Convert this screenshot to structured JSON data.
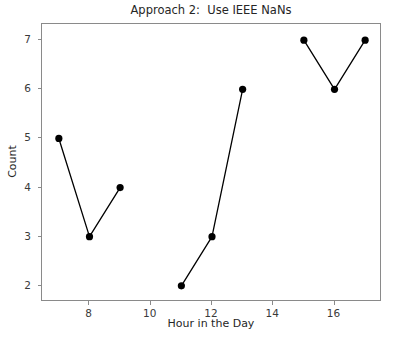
{
  "chart_data": {
    "type": "line",
    "title": "Approach 2:  Use IEEE NaNs",
    "xlabel": "Hour in the Day",
    "ylabel": "Count",
    "xlim": [
      6.45,
      17.55
    ],
    "ylim": [
      1.67,
      7.33
    ],
    "xticks": [
      8,
      10,
      12,
      14,
      16
    ],
    "xtick_labels": [
      "8",
      "10",
      "12",
      "14",
      "16"
    ],
    "yticks": [
      2,
      3,
      4,
      5,
      6,
      7
    ],
    "ytick_labels": [
      "2",
      "3",
      "4",
      "5",
      "6",
      "7"
    ],
    "grid": false,
    "legend": null,
    "marker": "o",
    "marker_size": 6,
    "line_width": 1.3,
    "series": [
      {
        "name": "Count",
        "color": "#000000",
        "x": [
          7,
          8,
          9,
          10,
          11,
          12,
          13,
          14,
          15,
          16,
          17
        ],
        "y": [
          5,
          3,
          4,
          null,
          2,
          3,
          6,
          null,
          7,
          6,
          7
        ],
        "nan_gaps_at_x": [
          10,
          14
        ],
        "points": [
          {
            "x": 7,
            "y": 5
          },
          {
            "x": 8,
            "y": 3
          },
          {
            "x": 9,
            "y": 4
          },
          {
            "x": 11,
            "y": 2
          },
          {
            "x": 12,
            "y": 3
          },
          {
            "x": 13,
            "y": 6
          },
          {
            "x": 15,
            "y": 7
          },
          {
            "x": 16,
            "y": 6
          },
          {
            "x": 17,
            "y": 7
          }
        ],
        "segments": [
          [
            {
              "x": 7,
              "y": 5
            },
            {
              "x": 8,
              "y": 3
            },
            {
              "x": 9,
              "y": 4
            }
          ],
          [
            {
              "x": 11,
              "y": 2
            },
            {
              "x": 12,
              "y": 3
            },
            {
              "x": 13,
              "y": 6
            }
          ],
          [
            {
              "x": 15,
              "y": 7
            },
            {
              "x": 16,
              "y": 6
            },
            {
              "x": 17,
              "y": 7
            }
          ]
        ]
      }
    ],
    "colors": {
      "background": "#ffffff",
      "line": "#000000",
      "marker": "#000000",
      "axis": "#8a8a8a",
      "text": "#262626",
      "tick_text": "#3a3a3a"
    }
  }
}
